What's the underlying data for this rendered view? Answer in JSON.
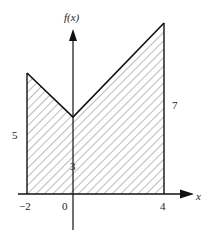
{
  "figure": {
    "type": "area-under-curve",
    "axis_labels": {
      "x": "x",
      "y": "f(x)"
    },
    "tick_labels": [
      "-2",
      "0",
      "4"
    ],
    "side_labels": {
      "left": "5",
      "center": "3",
      "right": "7"
    },
    "function_points": [
      [
        -2,
        5
      ],
      [
        0,
        3
      ],
      [
        4,
        7
      ]
    ],
    "shaded_region": "hatched region between f(x) and x-axis from x = -2 to x = 4"
  },
  "labels": {
    "y_axis": "f(x)",
    "x_axis": "x",
    "tick_neg2": "−2",
    "tick_0": "0",
    "tick_4": "4",
    "height_left": "5",
    "height_center": "3",
    "height_right": "7"
  },
  "colors": {
    "stroke": "#111111",
    "hatch": "#444444",
    "background": "#ffffff"
  }
}
